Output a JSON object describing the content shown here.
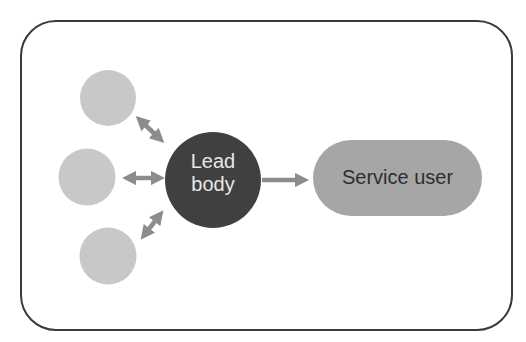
{
  "diagram": {
    "type": "hub-and-spoke flow",
    "nodes": {
      "peers": [
        {
          "id": "peer-top",
          "label": ""
        },
        {
          "id": "peer-middle",
          "label": ""
        },
        {
          "id": "peer-bottom",
          "label": ""
        }
      ],
      "lead": {
        "label_line1": "Lead",
        "label_line2": "body"
      },
      "service": {
        "label": "Service user"
      }
    },
    "edges": [
      {
        "from": "peer-top",
        "to": "lead",
        "style": "bidirectional"
      },
      {
        "from": "peer-middle",
        "to": "lead",
        "style": "bidirectional"
      },
      {
        "from": "peer-bottom",
        "to": "lead",
        "style": "bidirectional"
      },
      {
        "from": "lead",
        "to": "service",
        "style": "directed"
      }
    ],
    "colors": {
      "frame_border": "#3a3a3a",
      "peer_fill": "#c8c8c8",
      "lead_fill": "#404040",
      "lead_text": "#e8e8e8",
      "service_fill": "#a6a6a6",
      "service_text": "#2e2e2e",
      "arrow": "#8c8c8c"
    }
  }
}
